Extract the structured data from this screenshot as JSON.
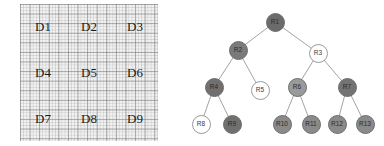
{
  "figure": {
    "left_panel": {
      "name": "data-grid",
      "rows": 3,
      "columns": 3,
      "cells": [
        {
          "id": "D1",
          "label": "D1"
        },
        {
          "id": "D2",
          "label": "D2"
        },
        {
          "id": "D3",
          "label": "D3"
        },
        {
          "id": "D4",
          "label": "D4"
        },
        {
          "id": "D5",
          "label": "D5"
        },
        {
          "id": "D6",
          "label": "D6"
        },
        {
          "id": "D7",
          "label": "D7"
        },
        {
          "id": "D8",
          "label": "D8"
        },
        {
          "id": "D9",
          "label": "D9"
        }
      ],
      "background_color": "#f2f2f2",
      "grid_line_color": "#787878",
      "label_color": "#1a1a1a"
    },
    "right_panel": {
      "name": "region-tree",
      "nodes": [
        {
          "id": "R1",
          "label": "R1",
          "x": 83,
          "y": 22,
          "fill": "#6b6b6b",
          "style": "filled",
          "parent": null
        },
        {
          "id": "R2",
          "label": "R2",
          "x": 46,
          "y": 50,
          "fill": "#7a7a7a",
          "style": "filled",
          "parent": "R1"
        },
        {
          "id": "R3",
          "label": "R3",
          "x": 126,
          "y": 53,
          "fill": "#ffffff",
          "style": "open",
          "parent": "R1"
        },
        {
          "id": "R4",
          "label": "R4",
          "x": 22,
          "y": 87,
          "fill": "#707070",
          "style": "filled",
          "parent": "R2"
        },
        {
          "id": "R5",
          "label": "R5",
          "x": 68,
          "y": 90,
          "fill": "#ffffff",
          "style": "open",
          "parent": "R2"
        },
        {
          "id": "R6",
          "label": "R6",
          "x": 105,
          "y": 87,
          "fill": "#9a9a9a",
          "style": "filled",
          "parent": "R3"
        },
        {
          "id": "R7",
          "label": "R7",
          "x": 155,
          "y": 87,
          "fill": "#737373",
          "style": "filled",
          "parent": "R3"
        },
        {
          "id": "R8",
          "label": "R8",
          "x": 9,
          "y": 124,
          "fill": "#ffffff",
          "style": "open",
          "parent": "R4"
        },
        {
          "id": "R9",
          "label": "R9",
          "x": 40,
          "y": 124,
          "fill": "#707070",
          "style": "filled",
          "parent": "R4"
        },
        {
          "id": "R10",
          "label": "R10",
          "x": 90,
          "y": 124,
          "fill": "#8a8a8a",
          "style": "filled",
          "parent": "R6"
        },
        {
          "id": "R11",
          "label": "R11",
          "x": 119,
          "y": 124,
          "fill": "#8a8a8a",
          "style": "filled",
          "parent": "R6"
        },
        {
          "id": "R12",
          "label": "R12",
          "x": 145,
          "y": 124,
          "fill": "#8a8a8a",
          "style": "filled",
          "parent": "R7"
        },
        {
          "id": "R13",
          "label": "R13",
          "x": 173,
          "y": 124,
          "fill": "#8a8a8a",
          "style": "filled",
          "parent": "R7"
        }
      ],
      "edge_color": "#8c8c8c"
    }
  }
}
